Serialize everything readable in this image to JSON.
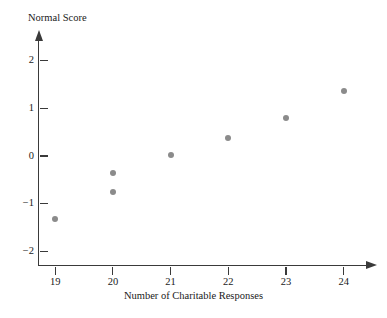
{
  "chart_data": {
    "type": "scatter",
    "title": "",
    "xlabel": "Number of Charitable Responses",
    "ylabel": "Normal Score",
    "xlim": [
      18.35,
      24.7
    ],
    "ylim": [
      -2.3,
      2.4
    ],
    "grid": false,
    "legend": null,
    "marker_color": "#8b8b8b",
    "axis_color": "#3a3a3a",
    "xticks": [
      19,
      20,
      21,
      22,
      23,
      24
    ],
    "xtick_labels": [
      "19",
      "20",
      "21",
      "22",
      "23",
      "24"
    ],
    "yticks": [
      2,
      1,
      0,
      -1,
      -2
    ],
    "ytick_labels": [
      "2",
      "1",
      "0",
      "−1",
      "−2"
    ],
    "points": [
      {
        "x": 19,
        "y": -1.32
      },
      {
        "x": 20,
        "y": -0.35
      },
      {
        "x": 20,
        "y": -0.76
      },
      {
        "x": 21,
        "y": 0.02
      },
      {
        "x": 22,
        "y": 0.38
      },
      {
        "x": 23,
        "y": 0.8
      },
      {
        "x": 24,
        "y": 1.36
      }
    ]
  }
}
